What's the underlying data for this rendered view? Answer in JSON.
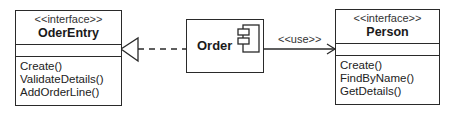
{
  "diagram": {
    "type": "UML component diagram",
    "interfaces": [
      {
        "id": "oderentry",
        "stereotype": "<<interface>>",
        "name": "OderEntry",
        "operations": [
          "Create()",
          "ValidateDetails()",
          "AddOrderLine()"
        ]
      },
      {
        "id": "person",
        "stereotype": "<<interface>>",
        "name": "Person",
        "operations": [
          "Create()",
          "FindByName()",
          "GetDetails()"
        ]
      }
    ],
    "component": {
      "name": "Order",
      "icon": "component-icon"
    },
    "relations": [
      {
        "from": "Order",
        "to": "OderEntry",
        "kind": "realization",
        "style": "dashed",
        "arrow": "hollow-triangle"
      },
      {
        "from": "Order",
        "to": "Person",
        "kind": "dependency",
        "label": "<<use>>",
        "arrow": "open"
      }
    ],
    "colors": {
      "line": "#2a2a2a",
      "background": "#ffffff",
      "text": "#222222"
    }
  }
}
